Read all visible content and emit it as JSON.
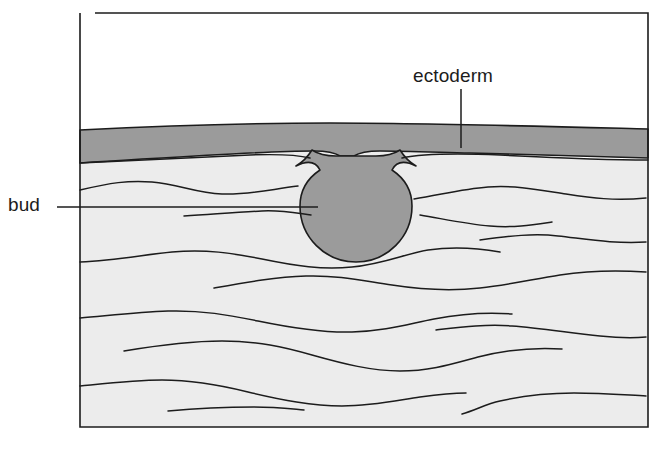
{
  "figure": {
    "kind": "biological-cross-section-diagram",
    "width_px": 657,
    "height_px": 450
  },
  "labels": {
    "ectoderm": {
      "text": "ectoderm",
      "x": 413,
      "y": 82,
      "leader": {
        "type": "vertical",
        "x": 461,
        "y1": 89,
        "y2": 148
      }
    },
    "bud": {
      "text": "bud",
      "x": 8,
      "y": 211,
      "leader": {
        "type": "horizontal",
        "y": 207,
        "x1": 57,
        "x2": 318
      }
    }
  },
  "regions": {
    "air_space": {
      "name": "white space above ectoderm",
      "fill": "#ffffff"
    },
    "ectoderm_layer": {
      "name": "ectoderm",
      "fill": "#9b9b9b",
      "top_y": 128,
      "bottom_y": 163
    },
    "bud": {
      "name": "bud",
      "fill": "#9b9b9b",
      "center_x": 356,
      "center_y": 206,
      "radius": 56
    },
    "mesenchyme": {
      "name": "mesenchyme",
      "fill": "#ececec",
      "top_y": 150,
      "bottom_y": 426
    }
  },
  "colors": {
    "outline": "#1c1c1c",
    "ectoderm_gray": "#9b9b9b",
    "bud_gray": "#9b9b9b",
    "mesenchyme_light": "#ececec",
    "background_white": "#ffffff",
    "label_text": "#1c1c1c"
  },
  "frame": {
    "left_x": 79,
    "right_x": 648,
    "top_y": 12,
    "bottom_y": 427,
    "stroke_width": 1.6
  },
  "mesenchyme_fibers": [
    "M 80,190 C 110,183 128,180 152,182 C 178,184 196,193 222,194 C 250,195 272,189 298,186",
    "M 184,216 C 216,214 238,212 262,211 C 282,210 296,213 311,215",
    "M 414,199 C 440,195 462,189 488,187 C 516,185 540,190 566,194 C 592,198 614,201 646,198",
    "M 420,215 C 444,219 466,224 490,226 C 514,228 532,225 552,222",
    "M 80,262 C 116,260 142,255 172,252 C 206,249 232,253 262,259 C 296,266 322,270 352,267 C 384,264 404,254 428,250 C 454,246 478,248 500,252",
    "M 480,240 C 510,236 534,233 558,236 C 586,239 614,244 646,242",
    "M 214,288 C 248,282 276,277 306,276 C 340,275 364,281 392,285 C 424,290 452,291 480,288 C 508,285 534,279 560,275 C 586,271 616,270 646,272",
    "M 80,318 C 114,315 140,312 168,311 C 202,310 228,315 258,321 C 292,328 322,333 352,332 C 386,331 408,324 434,319 C 460,314 486,312 512,314",
    "M 436,330 C 462,327 486,324 512,326 C 540,328 570,333 600,336 C 620,338 634,338 646,337",
    "M 124,351 C 160,345 192,341 222,341 C 258,341 284,347 312,355 C 344,364 372,371 400,371 C 430,371 452,364 478,357 C 506,350 534,347 562,349",
    "M 80,386 C 110,383 136,380 162,380 C 194,380 220,385 248,392 C 282,400 312,406 342,406 C 372,406 394,401 420,397 C 442,394 456,393 466,393",
    "M 168,411 C 200,408 228,407 254,407 C 276,407 292,409 304,410",
    "M 462,414 C 476,410 486,404 500,401 C 522,396 548,393 574,393 C 602,393 626,395 646,396"
  ]
}
